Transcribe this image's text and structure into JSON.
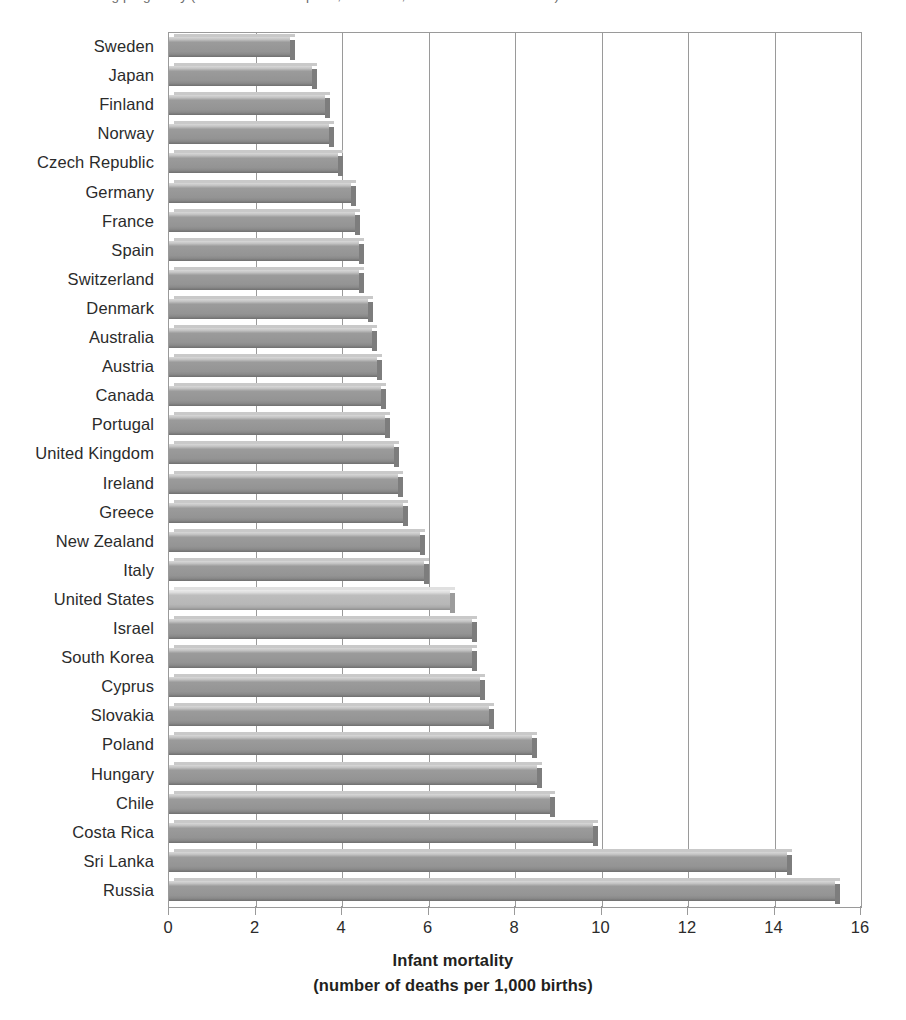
{
  "caption": {
    "cropped_text": "ng pregnancy (number of deaths per 1,000 births, OECD Health Database)"
  },
  "chart_data": {
    "type": "bar",
    "orientation": "horizontal",
    "title": "",
    "xlabel": "Infant mortality",
    "xlabel_line2": "(number of deaths per 1,000 births)",
    "ylabel": "",
    "xlim": [
      0,
      16
    ],
    "xticks": [
      "0",
      "2",
      "4",
      "6",
      "8",
      "10",
      "12",
      "14",
      "16"
    ],
    "xtick_values": [
      0,
      2,
      4,
      6,
      8,
      10,
      12,
      14,
      16
    ],
    "grid": true,
    "grid_axis": "x",
    "legend": "none",
    "highlight_category": "United States",
    "colors": {
      "bar": "#949494",
      "bar_highlight": "#b7b7b7",
      "bar_shadow": "#7d7d7d",
      "axis": "#9a9a9a",
      "text": "#231f20"
    },
    "categories": [
      "Sweden",
      "Japan",
      "Finland",
      "Norway",
      "Czech Republic",
      "Germany",
      "France",
      "Spain",
      "Switzerland",
      "Denmark",
      "Australia",
      "Austria",
      "Canada",
      "Portugal",
      "United Kingdom",
      "Ireland",
      "Greece",
      "New Zealand",
      "Italy",
      "United States",
      "Israel",
      "South Korea",
      "Cyprus",
      "Slovakia",
      "Poland",
      "Hungary",
      "Chile",
      "Costa Rica",
      "Sri Lanka",
      "Russia"
    ],
    "values": [
      2.8,
      3.3,
      3.6,
      3.7,
      3.9,
      4.2,
      4.3,
      4.4,
      4.4,
      4.6,
      4.7,
      4.8,
      4.9,
      5.0,
      5.2,
      5.3,
      5.4,
      5.8,
      5.9,
      6.5,
      7.0,
      7.0,
      7.2,
      7.4,
      8.4,
      8.5,
      8.8,
      9.8,
      14.3,
      15.4
    ]
  }
}
